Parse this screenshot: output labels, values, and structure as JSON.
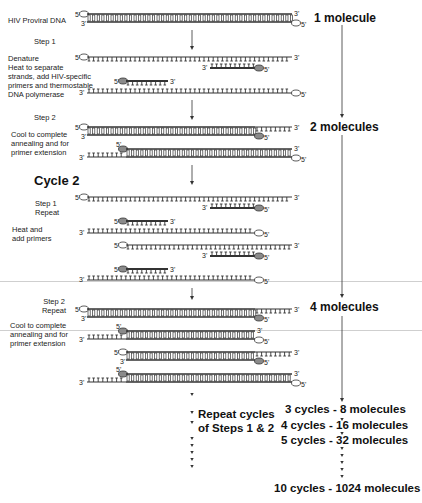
{
  "figure": {
    "start_label": "HIV Proviral DNA",
    "cycle1": {
      "step1": {
        "title": "Step 1",
        "heading": "Denature",
        "description_lines": [
          "Heat to separate",
          "strands, add HIV-specific",
          "primers and thermostable",
          "DNA polymerase"
        ]
      },
      "step2": {
        "title": "Step 2",
        "description_lines": [
          "Cool to complete",
          "annealing and for",
          "primer extension"
        ]
      }
    },
    "cycle2": {
      "title": "Cycle 2",
      "step1": {
        "title_lines": [
          "Step 1",
          "Repeat"
        ],
        "description_lines": [
          "Heat and",
          "add primers"
        ]
      },
      "step2": {
        "title_lines": [
          "Step 2",
          "Repeat"
        ],
        "description_lines": [
          "Cool to complete",
          "annealing and for",
          "primer extension"
        ]
      }
    },
    "repeat_label_lines": [
      "Repeat cycles",
      "of Steps 1 & 2"
    ],
    "strand_end_labels": {
      "five_prime": "5'",
      "three_prime": "3'"
    },
    "molecule_counts": [
      {
        "label": "1 molecule"
      },
      {
        "label": "2 molecules"
      },
      {
        "label": "4 molecules"
      }
    ],
    "cycle_counts": [
      {
        "cycles": 3,
        "molecules": 8,
        "label": "3 cycles - 8 molecules"
      },
      {
        "cycles": 4,
        "molecules": 16,
        "label": "4 cycles - 16 molecules"
      },
      {
        "cycles": 5,
        "molecules": 32,
        "label": "5 cycles - 32 molecules"
      },
      {
        "cycles": 10,
        "molecules": 1024,
        "label": "10 cycles - 1024 molecules"
      }
    ],
    "colors": {
      "strand": "#333333",
      "primer_fill": "#8a8a8a",
      "cap_open": "#ffffff",
      "arrow": "#333333"
    }
  }
}
